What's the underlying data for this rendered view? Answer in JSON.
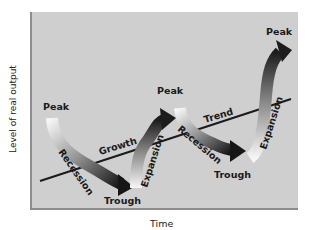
{
  "diagram": {
    "y_axis_label": "Level of real output",
    "x_axis_label": "Time",
    "labels": {
      "peak_1": "Peak",
      "peak_2": "Peak",
      "peak_3": "Peak",
      "trough_1": "Trough",
      "trough_2": "Trough",
      "recession_1": "Recession",
      "recession_2": "Recession",
      "expansion_1": "Expansion",
      "expansion_2": "Expansion",
      "growth": "Growth",
      "trend": "Trend"
    },
    "colors": {
      "panel_bg": "#cfcfcf",
      "panel_border": "#8d8d8d",
      "trend_line": "#1a1a1a",
      "arrow_dark": "#1c1c1c",
      "arrow_light": "#f4f4f4"
    }
  }
}
